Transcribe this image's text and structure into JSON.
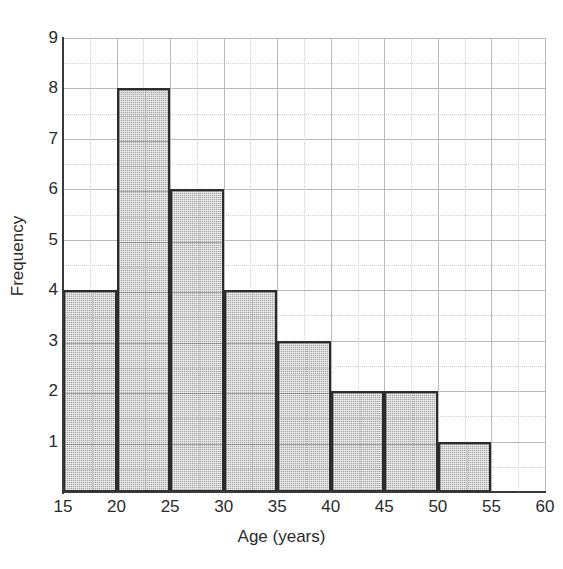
{
  "chart_data": {
    "type": "bar",
    "title": "",
    "subtitle": "",
    "xlabel": "Age (years)",
    "ylabel": "Frequency",
    "categories": [
      "15-20",
      "20-25",
      "25-30",
      "30-35",
      "35-40",
      "40-45",
      "45-50",
      "50-55"
    ],
    "bin_edges": [
      15,
      20,
      25,
      30,
      35,
      40,
      45,
      50,
      55
    ],
    "values": [
      4,
      8,
      6,
      4,
      3,
      2,
      2,
      1
    ],
    "bin_width": 5,
    "xlim": [
      15,
      60
    ],
    "ylim": [
      0,
      9
    ],
    "xticks": [
      15,
      20,
      25,
      30,
      35,
      40,
      45,
      50,
      55,
      60
    ],
    "yticks": [
      1,
      2,
      3,
      4,
      5,
      6,
      7,
      8,
      9
    ],
    "x_minor_step": 2.5,
    "y_minor_step": 0.5,
    "grid": true,
    "grid_major_color": "#b9b9b9",
    "grid_minor_color": "#cfcfcf",
    "legend": null,
    "legend_position": "none",
    "bar_edge_color": "#2c2c2c",
    "bar_fill_color": "#a9a9a9",
    "axis_color": "#3a3a3a",
    "background_color": "#ffffff",
    "total_frequency": 30,
    "annotations": []
  },
  "axes": {
    "x_title": "Age (years)",
    "y_title": "Frequency",
    "x_tick_labels": [
      "15",
      "20",
      "25",
      "30",
      "35",
      "40",
      "45",
      "50",
      "55",
      "60"
    ],
    "y_tick_labels": [
      "9",
      "8",
      "7",
      "6",
      "5",
      "4",
      "3",
      "2",
      "1"
    ]
  }
}
